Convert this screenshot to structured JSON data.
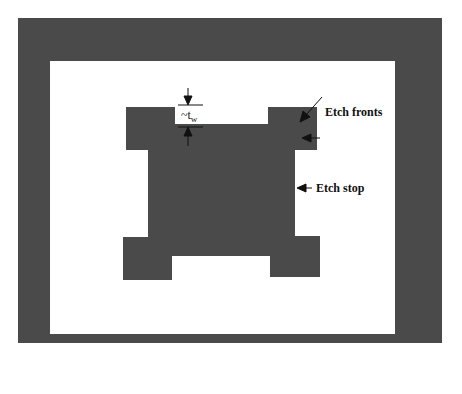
{
  "diagram": {
    "type": "etched-mask-schematic",
    "colors": {
      "etched_region": "#4a4a4a",
      "background": "#ffffff",
      "annotation": "#111111"
    },
    "labels": {
      "etch_fronts": "Etch fronts",
      "etch_stop": "Etch stop",
      "tw_prefix": "~t",
      "tw_sub": "w"
    }
  }
}
